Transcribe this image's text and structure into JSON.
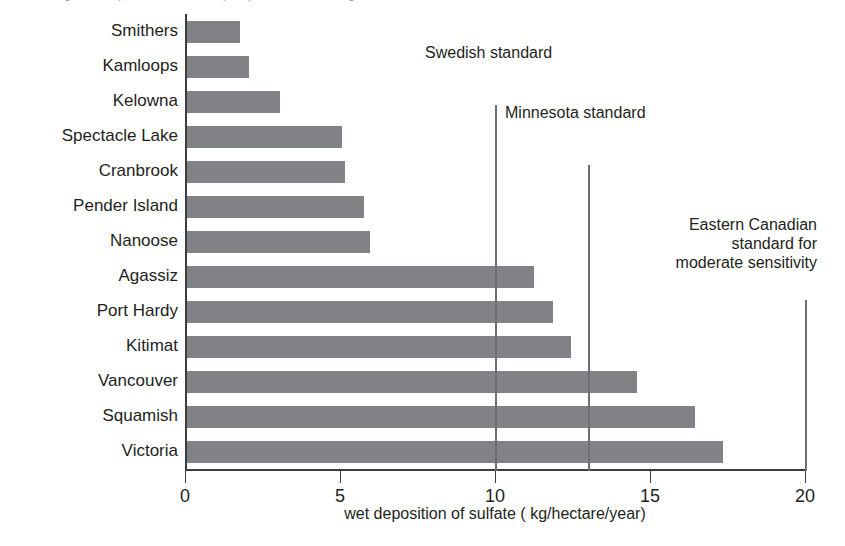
{
  "top_caption": "Figure 3.  Deposition of sulfate in precipitation at monitoring sites in British Columbia",
  "chart_data": {
    "type": "bar",
    "orientation": "horizontal",
    "title": "",
    "xlabel": "wet deposition of sulfate  ( kg/hectare/year)",
    "ylabel": "",
    "xlim": [
      0,
      20
    ],
    "xticks": [
      0,
      5,
      10,
      15,
      20
    ],
    "xtick_labels": [
      "0",
      "5",
      "10",
      "15",
      "20"
    ],
    "grid": false,
    "legend": "none",
    "bar_color": "#808285",
    "axis_color": "#3d3d3d",
    "categories": [
      "Smithers",
      "Kamloops",
      "Kelowna",
      "Spectacle Lake",
      "Cranbrook",
      "Pender Island",
      "Nanoose",
      "Agassiz",
      "Port Hardy",
      "Kitimat",
      "Vancouver",
      "Squamish",
      "Victoria"
    ],
    "values": [
      1.7,
      2.0,
      3.0,
      5.0,
      5.1,
      5.7,
      5.9,
      11.2,
      11.8,
      12.4,
      14.5,
      16.4,
      17.3
    ],
    "annotations": [
      {
        "label": "Swedish standard",
        "x": 10.0,
        "lines": [
          "Swedish standard"
        ]
      },
      {
        "label": "Minnesota standard",
        "x": 13.0,
        "lines": [
          "Minnesota standard"
        ]
      },
      {
        "label": "Eastern Canadian standard for moderate sensitivity",
        "x": 20.0,
        "lines": [
          "Eastern Canadian",
          "standard for",
          "moderate sensitivity"
        ]
      }
    ]
  }
}
